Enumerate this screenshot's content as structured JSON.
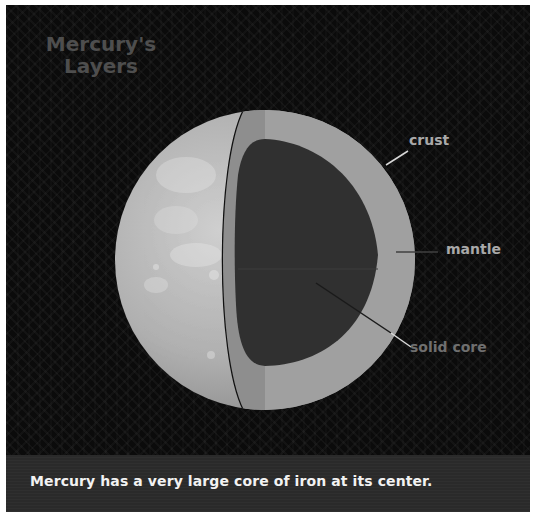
{
  "title": {
    "line1": "Mercury's",
    "line2": "Layers"
  },
  "labels": {
    "crust": "crust",
    "mantle": "mantle",
    "core": "solid core"
  },
  "caption": "Mercury has a very large core of iron at its center.",
  "colors": {
    "background": "#0b0b0b",
    "surface": "#b5b5b5",
    "crust_band": "#8e8e8e",
    "mantle": "#a0a0a0",
    "core": "#303030",
    "title": "#4e4e4e",
    "label": "#a9a9a9",
    "caption_band": "#2a2a2a",
    "caption_text": "#f2f2f2"
  }
}
